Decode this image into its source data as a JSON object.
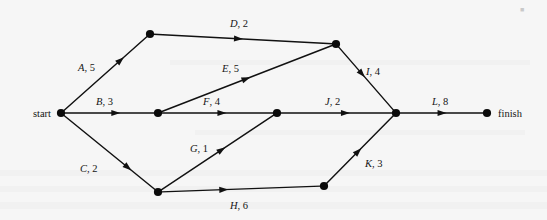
{
  "figure": {
    "kind": "activity-on-arc-network",
    "background_color": "#f6f6f6",
    "ink_color": "#111111",
    "width": 547,
    "height": 220
  },
  "terminals": {
    "start_label": "start",
    "finish_label": "finish"
  },
  "nodes": [
    {
      "id": "start",
      "name": "start-node",
      "x": 61,
      "y": 113
    },
    {
      "id": "n1",
      "name": "node-top-left",
      "x": 150,
      "y": 34
    },
    {
      "id": "n2",
      "name": "node-mid-left",
      "x": 158,
      "y": 113
    },
    {
      "id": "n3",
      "name": "node-bottom-left",
      "x": 158,
      "y": 192
    },
    {
      "id": "n4",
      "name": "node-top-right",
      "x": 336,
      "y": 44
    },
    {
      "id": "n5",
      "name": "node-mid-center",
      "x": 277,
      "y": 113
    },
    {
      "id": "n6",
      "name": "node-bottom-right",
      "x": 324,
      "y": 186
    },
    {
      "id": "n7",
      "name": "node-converge",
      "x": 396,
      "y": 113
    },
    {
      "id": "finish",
      "name": "finish-node",
      "x": 487,
      "y": 113
    }
  ],
  "edges": [
    {
      "id": "A",
      "activity": "A",
      "duration": 5,
      "label": "A, 5",
      "from": "start",
      "to": "n1",
      "label_x": 78,
      "label_y": 71,
      "arrow_t": 0.72,
      "anchor": "start"
    },
    {
      "id": "B",
      "activity": "B",
      "duration": 3,
      "label": "B, 3",
      "from": "start",
      "to": "n2",
      "label_x": 96,
      "label_y": 105,
      "arrow_t": 0.62,
      "anchor": "start"
    },
    {
      "id": "C",
      "activity": "C",
      "duration": 2,
      "label": "C, 2",
      "from": "start",
      "to": "n3",
      "label_x": 80,
      "label_y": 172,
      "arrow_t": 0.74,
      "anchor": "start"
    },
    {
      "id": "D",
      "activity": "D",
      "duration": 2,
      "label": "D, 2",
      "from": "n1",
      "to": "n4",
      "label_x": 230,
      "label_y": 27,
      "arrow_t": 0.5,
      "anchor": "start"
    },
    {
      "id": "E",
      "activity": "E",
      "duration": 5,
      "label": "E, 5",
      "from": "n2",
      "to": "n4",
      "label_x": 222,
      "label_y": 72,
      "arrow_t": 0.52,
      "anchor": "start"
    },
    {
      "id": "F",
      "activity": "F",
      "duration": 4,
      "label": "F, 4",
      "from": "n2",
      "to": "n5",
      "label_x": 203,
      "label_y": 105,
      "arrow_t": 0.58,
      "anchor": "start"
    },
    {
      "id": "G",
      "activity": "G",
      "duration": 1,
      "label": "G, 1",
      "from": "n3",
      "to": "n5",
      "label_x": 190,
      "label_y": 152,
      "arrow_t": 0.57,
      "anchor": "start"
    },
    {
      "id": "H",
      "activity": "H",
      "duration": 6,
      "label": "H, 6",
      "from": "n3",
      "to": "n6",
      "label_x": 230,
      "label_y": 209,
      "arrow_t": 0.42,
      "anchor": "start"
    },
    {
      "id": "I",
      "activity": "I",
      "duration": 4,
      "label": "I, 4",
      "from": "n4",
      "to": "n7",
      "label_x": 366,
      "label_y": 75,
      "arrow_t": 0.48,
      "anchor": "start"
    },
    {
      "id": "J",
      "activity": "J",
      "duration": 2,
      "label": "J, 2",
      "from": "n5",
      "to": "n7",
      "label_x": 325,
      "label_y": 105,
      "arrow_t": 0.62,
      "anchor": "start"
    },
    {
      "id": "K",
      "activity": "K",
      "duration": 3,
      "label": "K, 3",
      "from": "n6",
      "to": "n7",
      "label_x": 365,
      "label_y": 167,
      "arrow_t": 0.52,
      "anchor": "start"
    },
    {
      "id": "L",
      "activity": "L",
      "duration": 8,
      "label": "L, 8",
      "from": "n7",
      "to": "finish",
      "label_x": 432,
      "label_y": 105,
      "arrow_t": 0.56,
      "anchor": "start"
    }
  ]
}
